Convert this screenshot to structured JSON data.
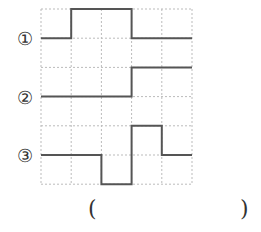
{
  "diagram": {
    "grid": {
      "left": 41,
      "top": 9,
      "col_width": 30.2,
      "row_height": 29.2,
      "cols": 5,
      "rows": 6,
      "line_color": "#bbbbbb",
      "signal_color": "#555555"
    },
    "signals": [
      {
        "label": "①",
        "levels": [
          0,
          1,
          1,
          0,
          0
        ],
        "baseline_row": 1
      },
      {
        "label": "②",
        "levels": [
          0,
          0,
          0,
          1,
          1
        ],
        "baseline_row": 3
      },
      {
        "label": "③",
        "levels": [
          0,
          0,
          -1,
          1,
          0
        ],
        "baseline_row": 5
      }
    ],
    "answer": {
      "open": "(",
      "close": ")"
    }
  }
}
